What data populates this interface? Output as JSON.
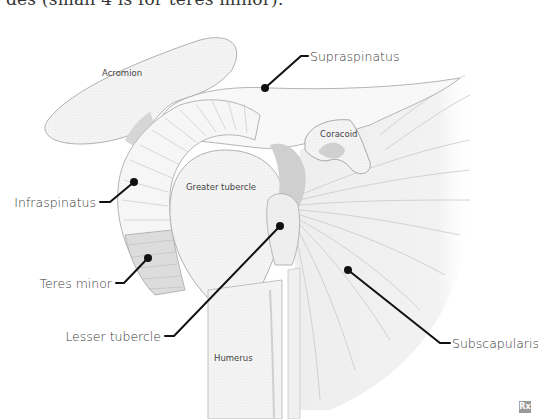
{
  "caption_fragment": "des (small 4 is for teres minor).",
  "figure": {
    "structures": {
      "acromion": "Acromion",
      "coracoid": "Coracoid",
      "greater_tubercle": "Greater tubercle",
      "humerus": "Humerus"
    },
    "callouts": [
      {
        "label": "Supraspinatus",
        "dot": [
          265,
          88
        ],
        "text_pos": [
          310,
          60
        ]
      },
      {
        "label": "Infraspinatus",
        "dot": [
          134,
          182
        ],
        "text_pos": [
          22,
          206
        ]
      },
      {
        "label": "Teres minor",
        "dot": [
          148,
          258
        ],
        "text_pos": [
          40,
          284
        ]
      },
      {
        "label": "Lesser tubercle",
        "dot": [
          280,
          226
        ],
        "text_pos": [
          71,
          340
        ]
      },
      {
        "label": "Subscapularis",
        "dot": [
          348,
          270
        ],
        "text_pos": [
          452,
          347
        ]
      }
    ],
    "colors": {
      "bone_fill": "#f2f2f2",
      "outline": "#b8b8b8",
      "shadow": "#cfcfcf",
      "leader": "#111111"
    }
  },
  "badge": "Rx"
}
